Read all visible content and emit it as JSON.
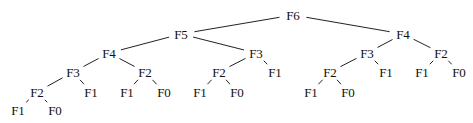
{
  "diagram": {
    "type": "tree",
    "colors": {
      "background": "#ffffff",
      "edge": "#222222",
      "text": "#111111"
    },
    "nodes": [
      {
        "id": "n0",
        "label": "F6",
        "x": 293,
        "y": 15
      },
      {
        "id": "n1",
        "label": "F5",
        "x": 181,
        "y": 34
      },
      {
        "id": "n2",
        "label": "F4",
        "x": 403,
        "y": 34
      },
      {
        "id": "n3",
        "label": "F4",
        "x": 109,
        "y": 53
      },
      {
        "id": "n4",
        "label": "F3",
        "x": 256,
        "y": 53
      },
      {
        "id": "n5",
        "label": "F3",
        "x": 367,
        "y": 53
      },
      {
        "id": "n6",
        "label": "F2",
        "x": 441,
        "y": 53
      },
      {
        "id": "n7",
        "label": "F3",
        "x": 73,
        "y": 72
      },
      {
        "id": "n8",
        "label": "F2",
        "x": 145,
        "y": 72
      },
      {
        "id": "n9",
        "label": "F2",
        "x": 219,
        "y": 72
      },
      {
        "id": "n10",
        "label": "F1",
        "x": 275,
        "y": 72
      },
      {
        "id": "n11",
        "label": "F2",
        "x": 330,
        "y": 72
      },
      {
        "id": "n12",
        "label": "F1",
        "x": 386,
        "y": 72
      },
      {
        "id": "n13",
        "label": "F1",
        "x": 422,
        "y": 72
      },
      {
        "id": "n14",
        "label": "F0",
        "x": 459,
        "y": 72
      },
      {
        "id": "n15",
        "label": "F2",
        "x": 37,
        "y": 92
      },
      {
        "id": "n16",
        "label": "F1",
        "x": 91,
        "y": 92
      },
      {
        "id": "n17",
        "label": "F1",
        "x": 127,
        "y": 92
      },
      {
        "id": "n18",
        "label": "F0",
        "x": 164,
        "y": 92
      },
      {
        "id": "n19",
        "label": "F1",
        "x": 200,
        "y": 92
      },
      {
        "id": "n20",
        "label": "F0",
        "x": 237,
        "y": 92
      },
      {
        "id": "n21",
        "label": "F1",
        "x": 311,
        "y": 92
      },
      {
        "id": "n22",
        "label": "F0",
        "x": 348,
        "y": 92
      },
      {
        "id": "n23",
        "label": "F1",
        "x": 18,
        "y": 110
      },
      {
        "id": "n24",
        "label": "F0",
        "x": 55,
        "y": 110
      }
    ],
    "edges": [
      [
        "n0",
        "n1"
      ],
      [
        "n0",
        "n2"
      ],
      [
        "n1",
        "n3"
      ],
      [
        "n1",
        "n4"
      ],
      [
        "n2",
        "n5"
      ],
      [
        "n2",
        "n6"
      ],
      [
        "n3",
        "n7"
      ],
      [
        "n3",
        "n8"
      ],
      [
        "n4",
        "n9"
      ],
      [
        "n4",
        "n10"
      ],
      [
        "n5",
        "n11"
      ],
      [
        "n5",
        "n12"
      ],
      [
        "n6",
        "n13"
      ],
      [
        "n6",
        "n14"
      ],
      [
        "n7",
        "n15"
      ],
      [
        "n7",
        "n16"
      ],
      [
        "n8",
        "n17"
      ],
      [
        "n8",
        "n18"
      ],
      [
        "n9",
        "n19"
      ],
      [
        "n9",
        "n20"
      ],
      [
        "n11",
        "n21"
      ],
      [
        "n11",
        "n22"
      ],
      [
        "n15",
        "n23"
      ],
      [
        "n15",
        "n24"
      ]
    ]
  }
}
